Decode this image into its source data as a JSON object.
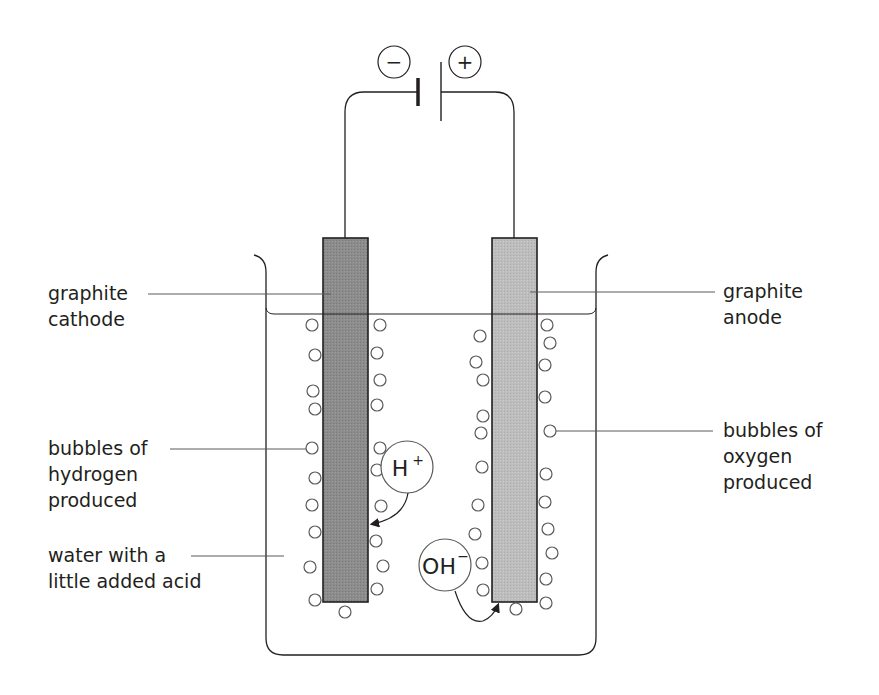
{
  "diagram": {
    "battery": {
      "negative_sign": "−",
      "positive_sign": "+"
    },
    "labels": {
      "cathode": [
        "graphite",
        "cathode"
      ],
      "anode": [
        "graphite",
        "anode"
      ],
      "hydrogen": [
        "bubbles of",
        "hydrogen",
        "produced"
      ],
      "oxygen": [
        "bubbles of",
        "oxygen",
        "produced"
      ],
      "water": [
        "water with a",
        "little added acid"
      ]
    },
    "ions": {
      "h_plus": {
        "base": "H",
        "charge": "+"
      },
      "oh_minus": {
        "base": "OH",
        "charge": "−"
      }
    },
    "colors": {
      "line": "#231f20",
      "cathode_fill": "#8c8c8c",
      "anode_fill": "#bdbdbd",
      "leader_line": "#5a5a5a"
    }
  }
}
